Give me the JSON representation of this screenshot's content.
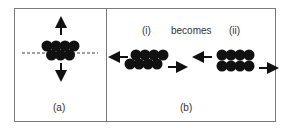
{
  "panels": {
    "a": {
      "label": "(a)"
    },
    "b": {
      "label": "(b)",
      "sub_i_label": "(i)",
      "connector": "becomes",
      "sub_ii_label": "(ii)"
    }
  },
  "colors": {
    "ink": "#111111",
    "frame": "#7a7a7a",
    "text": "#333333"
  }
}
